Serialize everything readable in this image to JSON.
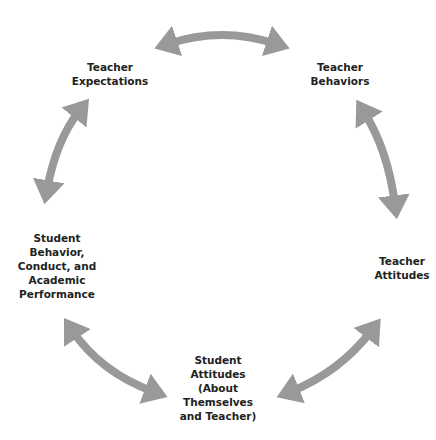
{
  "diagram": {
    "type": "cycle",
    "arrow_color": "#999999",
    "text_color": "#222222",
    "nodes": [
      {
        "id": "expectations",
        "label": "Teacher\nExpectations",
        "x": 110,
        "y": 60
      },
      {
        "id": "behaviors",
        "label": "Teacher\nBehaviors",
        "x": 340,
        "y": 60
      },
      {
        "id": "attitudes",
        "label": "Teacher\nAttitudes",
        "x": 402,
        "y": 254
      },
      {
        "id": "student_attitudes",
        "label": "Student\nAttitudes\n(About\nThemselves\nand Teacher)",
        "x": 218,
        "y": 353
      },
      {
        "id": "student_behavior",
        "label": "Student\nBehavior,\nConduct, and\nAcademic\nPerformance",
        "x": 57,
        "y": 231
      }
    ],
    "edges": [
      {
        "from": "expectations",
        "to": "behaviors",
        "bidirectional": true
      },
      {
        "from": "behaviors",
        "to": "attitudes",
        "bidirectional": true
      },
      {
        "from": "attitudes",
        "to": "student_attitudes",
        "bidirectional": true
      },
      {
        "from": "student_attitudes",
        "to": "student_behavior",
        "bidirectional": true
      },
      {
        "from": "student_behavior",
        "to": "expectations",
        "bidirectional": true
      }
    ]
  }
}
